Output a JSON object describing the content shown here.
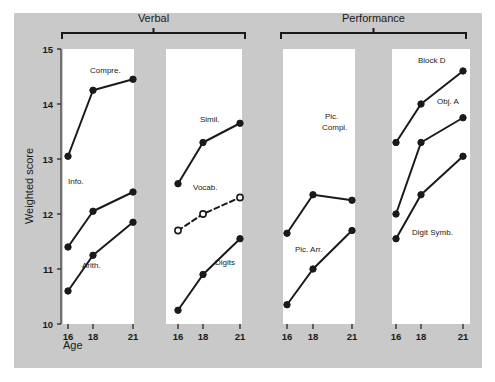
{
  "figure": {
    "background_color": "#c9c9c9",
    "panel_color": "#ffffff",
    "ink_color": "#1a1a1a",
    "y_axis_title": "Weighted score",
    "x_axis_title": "Age",
    "group_labels": [
      "Verbal",
      "Performance"
    ]
  },
  "chart_data": {
    "type": "line",
    "title": "",
    "subtitle": "",
    "xlabel": "Age",
    "ylabel": "Weighted score",
    "x": [
      16,
      18,
      21
    ],
    "x_tick_labels": [
      "16",
      "18",
      "21"
    ],
    "ylim": [
      10,
      15
    ],
    "y_ticks": [
      10,
      11,
      12,
      13,
      14,
      15
    ],
    "y_tick_labels": [
      "10",
      "11",
      "12",
      "13",
      "14",
      "15"
    ],
    "grid": false,
    "legend": "none",
    "groups": [
      {
        "name": "Verbal",
        "panels": [
          {
            "index": 0,
            "series": [
              {
                "name": "Compre.",
                "label": "Compre.",
                "marker": "filled-circle",
                "linestyle": "solid",
                "values": [
                  13.05,
                  14.25,
                  14.45
                ]
              },
              {
                "name": "Info.",
                "label": "Info.",
                "marker": "filled-circle",
                "linestyle": "solid",
                "values": [
                  11.4,
                  12.05,
                  12.4
                ]
              },
              {
                "name": "Arith.",
                "label": "Arith.",
                "marker": "filled-circle",
                "linestyle": "solid",
                "values": [
                  10.6,
                  11.25,
                  11.85
                ]
              }
            ]
          },
          {
            "index": 1,
            "series": [
              {
                "name": "Simil.",
                "label": "Simil.",
                "marker": "filled-circle",
                "linestyle": "solid",
                "values": [
                  12.55,
                  13.3,
                  13.65
                ]
              },
              {
                "name": "Vocab.",
                "label": "Vocab.",
                "marker": "open-circle",
                "linestyle": "dashed",
                "values": [
                  11.7,
                  12.0,
                  12.3
                ]
              },
              {
                "name": "Digits",
                "label": "Digits",
                "marker": "filled-circle",
                "linestyle": "solid",
                "values": [
                  10.25,
                  10.9,
                  11.55
                ]
              }
            ]
          }
        ]
      },
      {
        "name": "Performance",
        "panels": [
          {
            "index": 2,
            "series": [
              {
                "name": "Pic. Compl.",
                "label": "Pic.\nCompl.",
                "marker": "filled-circle",
                "linestyle": "solid",
                "values": [
                  11.65,
                  12.35,
                  12.25
                ]
              },
              {
                "name": "Pic. Arr.",
                "label": "Pic. Arr.",
                "marker": "filled-circle",
                "linestyle": "solid",
                "values": [
                  10.35,
                  11.0,
                  11.7
                ]
              }
            ]
          },
          {
            "index": 3,
            "series": [
              {
                "name": "Block D",
                "label": "Block D",
                "marker": "filled-circle",
                "linestyle": "solid",
                "values": [
                  13.3,
                  14.0,
                  14.6
                ]
              },
              {
                "name": "Obj. A",
                "label": "Obj. A",
                "marker": "filled-circle",
                "linestyle": "solid",
                "values": [
                  12.0,
                  13.3,
                  13.75
                ]
              },
              {
                "name": "Digit Symb.",
                "label": "Digit Symb.",
                "marker": "filled-circle",
                "linestyle": "solid",
                "values": [
                  11.55,
                  12.35,
                  13.05
                ]
              }
            ]
          }
        ]
      }
    ]
  },
  "annotations": {
    "series_label_positions": [
      {
        "panel": 0,
        "series": "Compre.",
        "x": 90,
        "y": 73
      },
      {
        "panel": 0,
        "series": "Info.",
        "x": 68,
        "y": 184
      },
      {
        "panel": 0,
        "series": "Arith.",
        "x": 82,
        "y": 268
      },
      {
        "panel": 1,
        "series": "Simil.",
        "x": 200,
        "y": 122
      },
      {
        "panel": 1,
        "series": "Vocab.",
        "x": 193,
        "y": 190
      },
      {
        "panel": 1,
        "series": "Digits",
        "x": 215,
        "y": 265
      },
      {
        "panel": 2,
        "series": "Pic.",
        "x": 325,
        "y": 119
      },
      {
        "panel": 2,
        "series": "Compl.",
        "x": 322,
        "y": 130
      },
      {
        "panel": 2,
        "series": "Pic. Arr.",
        "x": 295,
        "y": 252
      },
      {
        "panel": 3,
        "series": "Block D",
        "x": 418,
        "y": 63
      },
      {
        "panel": 3,
        "series": "Obj. A",
        "x": 437,
        "y": 104
      },
      {
        "panel": 3,
        "series": "Digit Symb.",
        "x": 412,
        "y": 235
      }
    ]
  }
}
